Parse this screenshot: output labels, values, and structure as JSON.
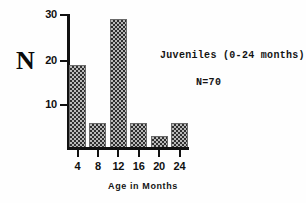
{
  "chart_data": {
    "type": "bar",
    "title": "",
    "subtitle": "",
    "xlabel": "Age in  Months",
    "ylabel": "N",
    "categories": [
      "4",
      "8",
      "12",
      "16",
      "20",
      "24"
    ],
    "values": [
      20,
      6,
      31,
      6,
      3,
      6
    ],
    "ylim": [
      0,
      32
    ],
    "yticks": [
      10,
      20,
      30
    ],
    "ytick_labels": [
      "10",
      "20",
      "30"
    ],
    "xticks": [
      4,
      8,
      12,
      16,
      20,
      24
    ],
    "xtick_labels": [
      "4",
      "8",
      "12",
      "16",
      "20",
      "24"
    ],
    "grid": false,
    "legend_position": "inside-upper-right",
    "annotations": [
      "Juveniles (0-24 months)",
      "N=70"
    ],
    "bar_fill": "stippled-checker",
    "colors": {
      "axis": "#111111",
      "bar_fill_dark": "#2f2f2f",
      "bar_fill_light": "#b9b9b9",
      "bar_edge": "#6a6a6a",
      "text": "#101010",
      "background": "#fefefe"
    }
  },
  "axes": {
    "y": {
      "title": "N",
      "ticks": [
        {
          "label": "30",
          "value": 30
        },
        {
          "label": "20",
          "value": 20
        },
        {
          "label": "10",
          "value": 10
        }
      ]
    },
    "x": {
      "title": "Age in  Months",
      "ticks": [
        {
          "label": "4",
          "value": 4
        },
        {
          "label": "8",
          "value": 8
        },
        {
          "label": "12",
          "value": 12
        },
        {
          "label": "16",
          "value": 16
        },
        {
          "label": "20",
          "value": 20
        },
        {
          "label": "24",
          "value": 24
        }
      ]
    }
  },
  "legend": {
    "group_label": "Juveniles (0-24 months)",
    "sample_size_label": "N=70"
  }
}
